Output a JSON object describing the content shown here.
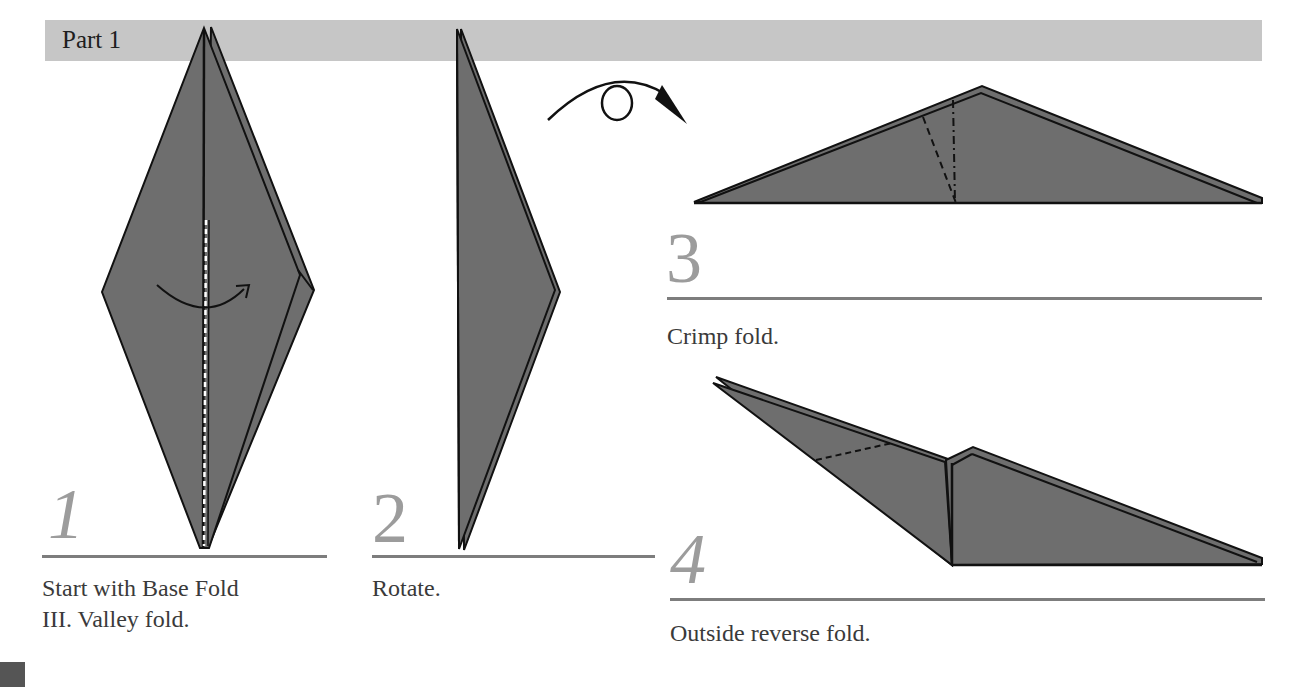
{
  "header": {
    "title": "Part 1"
  },
  "colors": {
    "bar": "#c6c6c6",
    "paper_fill": "#6e6e6e",
    "outline": "#111111",
    "step_number": "#9c9c9c",
    "rule": "#7d7d7d",
    "caption": "#3a3a3a"
  },
  "steps": [
    {
      "number": "1",
      "caption_line1": "Start with Base Fold",
      "caption_line2": "III. Valley fold.",
      "diagram": "kite-with-valley-fold-arrow"
    },
    {
      "number": "2",
      "caption_line1": "Rotate.",
      "diagram": "half-kite-rotated"
    },
    {
      "number": "3",
      "caption_line1": "Crimp fold.",
      "diagram": "wide-triangle-with-crimp-lines"
    },
    {
      "number": "4",
      "caption_line1": "Outside reverse fold.",
      "diagram": "reverse-folded-neck"
    }
  ],
  "symbols": {
    "rotate": "rotate-loop-arrow-icon",
    "valley_fold": "valley-fold-arrow-icon"
  }
}
